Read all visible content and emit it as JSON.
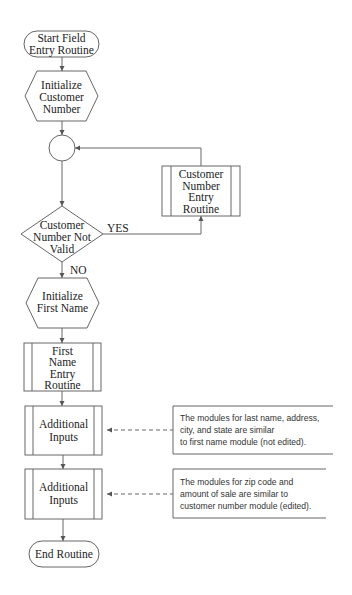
{
  "diagram": {
    "type": "flowchart",
    "nodes": {
      "start": {
        "shape": "terminal",
        "lines": [
          "Start Field",
          "Entry Routine"
        ]
      },
      "init_customer": {
        "shape": "hexagon",
        "lines": [
          "Initialize",
          "Customer",
          "Number"
        ]
      },
      "connector": {
        "shape": "circle",
        "lines": []
      },
      "decision": {
        "shape": "diamond",
        "lines": [
          "Customer",
          "Number Not",
          "Valid"
        ]
      },
      "customer_entry": {
        "shape": "predefined-process",
        "lines": [
          "Customer",
          "Number",
          "Entry",
          "Routine"
        ]
      },
      "init_first": {
        "shape": "hexagon",
        "lines": [
          "Initialize",
          "First Name"
        ]
      },
      "first_entry": {
        "shape": "predefined-process",
        "lines": [
          "First",
          "Name",
          "Entry",
          "Routine"
        ]
      },
      "additional_1": {
        "shape": "predefined-process",
        "lines": [
          "Additional",
          "Inputs"
        ]
      },
      "additional_2": {
        "shape": "predefined-process",
        "lines": [
          "Additional",
          "Inputs"
        ]
      },
      "end": {
        "shape": "terminal",
        "lines": [
          "End Routine"
        ]
      }
    },
    "edge_labels": {
      "yes": "YES",
      "no": "NO"
    },
    "annotations": [
      {
        "lines": [
          "The modules for last name, address,",
          "city, and state are similar",
          "to first name module (not edited)."
        ]
      },
      {
        "lines": [
          "The modules for zip code and",
          "amount of sale are similar to",
          "customer number module (edited)."
        ]
      }
    ],
    "edges": [
      [
        "start",
        "init_customer"
      ],
      [
        "init_customer",
        "connector"
      ],
      [
        "connector",
        "decision"
      ],
      [
        "decision",
        "customer_entry",
        "YES"
      ],
      [
        "customer_entry",
        "connector"
      ],
      [
        "decision",
        "init_first",
        "NO"
      ],
      [
        "init_first",
        "first_entry"
      ],
      [
        "first_entry",
        "additional_1"
      ],
      [
        "additional_1",
        "additional_2"
      ],
      [
        "additional_2",
        "end"
      ]
    ]
  }
}
